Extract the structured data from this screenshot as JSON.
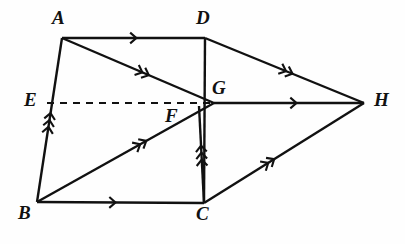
{
  "figure": {
    "kind": "geometry-diagram",
    "background_color": "#fefefe",
    "stroke_color": "#111111",
    "canvas": {
      "width": 405,
      "height": 244
    }
  },
  "vertices": [
    {
      "id": "A",
      "label": "A",
      "x": 62,
      "y": 38,
      "label_x": 52,
      "label_y": 8
    },
    {
      "id": "D",
      "label": "D",
      "x": 205,
      "y": 38,
      "label_x": 196,
      "label_y": 8
    },
    {
      "id": "E",
      "label": "E",
      "x": 47,
      "y": 103,
      "label_x": 24,
      "label_y": 90
    },
    {
      "id": "F",
      "label": "F",
      "x": 199,
      "y": 106,
      "label_x": 165,
      "label_y": 106
    },
    {
      "id": "G",
      "label": "G",
      "x": 214,
      "y": 103,
      "label_x": 212,
      "label_y": 78
    },
    {
      "id": "H",
      "label": "H",
      "x": 364,
      "y": 103,
      "label_x": 374,
      "label_y": 90
    },
    {
      "id": "B",
      "label": "B",
      "x": 37,
      "y": 202,
      "label_x": 18,
      "label_y": 203
    },
    {
      "id": "C",
      "label": "C",
      "x": 204,
      "y": 203,
      "label_x": 196,
      "label_y": 204
    }
  ],
  "edges": [
    {
      "id": "AD",
      "from": "A",
      "to": "D",
      "style": "solid",
      "marks": 1,
      "mark_t": 0.52
    },
    {
      "id": "AG",
      "from": "A",
      "to": "G",
      "style": "solid",
      "marks": 2,
      "mark_t": 0.55
    },
    {
      "id": "AB",
      "from": "B",
      "to": "A",
      "style": "solid",
      "marks": 3,
      "mark_t": 0.5
    },
    {
      "id": "DH",
      "from": "D",
      "to": "H",
      "style": "solid",
      "marks": 2,
      "mark_t": 0.53
    },
    {
      "id": "DC",
      "from": "D",
      "to": "C",
      "style": "solid",
      "marks": 0,
      "mark_t": 0.5
    },
    {
      "id": "EH",
      "from": "E",
      "to": "G",
      "style": "dashed",
      "marks": 0,
      "mark_t": 0.5
    },
    {
      "id": "GH",
      "from": "G",
      "to": "H",
      "style": "solid",
      "marks": 1,
      "mark_t": 0.55
    },
    {
      "id": "BG",
      "from": "B",
      "to": "G",
      "style": "solid",
      "marks": 2,
      "mark_t": 0.6
    },
    {
      "id": "BC",
      "from": "B",
      "to": "C",
      "style": "solid",
      "marks": 1,
      "mark_t": 0.47
    },
    {
      "id": "CF",
      "from": "C",
      "to": "F",
      "style": "solid",
      "marks": 3,
      "mark_t": 0.52
    },
    {
      "id": "CH",
      "from": "C",
      "to": "H",
      "style": "solid",
      "marks": 2,
      "mark_t": 0.42
    }
  ]
}
